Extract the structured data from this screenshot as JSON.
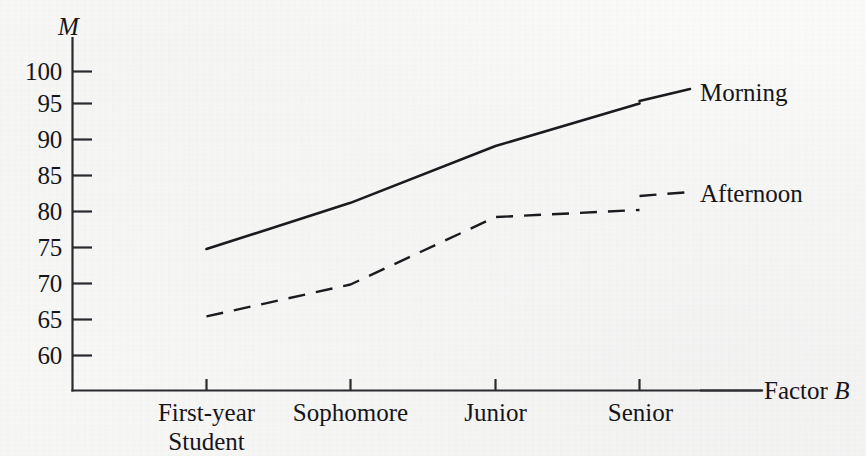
{
  "chart_data": {
    "type": "line",
    "title": "",
    "subtitle": "",
    "xlabel": "Factor B",
    "ylabel": "M",
    "categories": [
      "First-year Student",
      "Sophomore",
      "Junior",
      "Senior"
    ],
    "category_lines": [
      [
        "First-year",
        "Student"
      ],
      [
        "Sophomore",
        ""
      ],
      [
        "Junior",
        ""
      ],
      [
        "Senior",
        ""
      ]
    ],
    "series": [
      {
        "name": "Morning",
        "style": "solid",
        "values": [
          75,
          81.5,
          89.5,
          95.5
        ]
      },
      {
        "name": "Afternoon",
        "style": "dashed",
        "values": [
          65.5,
          70,
          79.5,
          80.5
        ]
      }
    ],
    "ylim": [
      57,
      102
    ],
    "ytick_labels": [
      "100",
      "95",
      "90",
      "85",
      "80",
      "75",
      "70",
      "65",
      "60"
    ],
    "ytick_values": [
      100,
      95,
      90,
      85,
      80,
      75,
      70,
      65,
      60
    ],
    "grid": false,
    "legend_position": "right-inline",
    "line_color": "#1a1a1f",
    "axis_color": "#2a2a30"
  },
  "axes": {
    "y_axis_label": "M",
    "x_axis_label_prefix": "Factor ",
    "x_axis_label_italic": "B"
  },
  "legend": {
    "morning": "Morning",
    "afternoon": "Afternoon"
  },
  "yticks": {
    "t0": "100",
    "t1": "95",
    "t2": "90",
    "t3": "85",
    "t4": "80",
    "t5": "75",
    "t6": "70",
    "t7": "65",
    "t8": "60"
  },
  "xticks": {
    "c0_l1": "First-year",
    "c0_l2": "Student",
    "c1_l1": "Sophomore",
    "c2_l1": "Junior",
    "c3_l1": "Senior"
  }
}
